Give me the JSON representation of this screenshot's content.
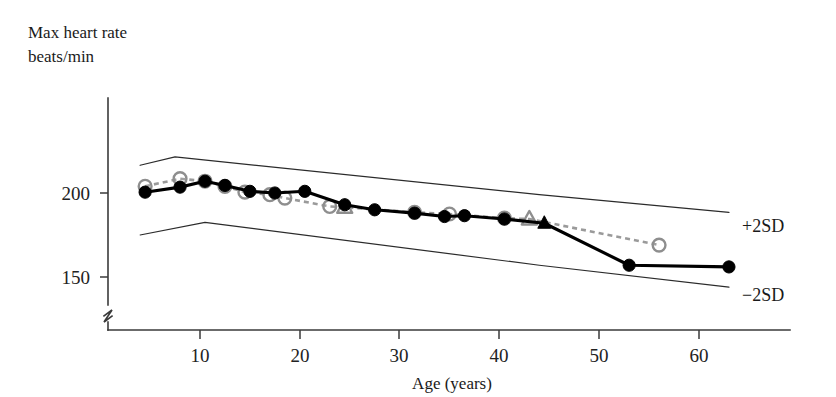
{
  "chart_data": {
    "type": "line",
    "title": "",
    "subtitle": "",
    "xlabel": "Age (years)",
    "ylabel_line1": "Max heart rate",
    "ylabel_line2": "beats/min",
    "xlim": [
      0,
      66
    ],
    "ylim": [
      130,
      235
    ],
    "grid": false,
    "axis_break": true,
    "legend_position": "right-inline",
    "x_ticks": [
      10,
      20,
      30,
      40,
      50,
      60
    ],
    "x_tick_labels": [
      "10",
      "20",
      "30",
      "40",
      "50",
      "60"
    ],
    "y_ticks": [
      150,
      200
    ],
    "y_tick_labels": [
      "150",
      "200"
    ],
    "annotations": [
      {
        "name": "upper-band-label",
        "text": "+2SD",
        "x": 64.5,
        "y": 188
      },
      {
        "name": "lower-band-label",
        "text": "−2SD",
        "x": 64.5,
        "y": 144
      }
    ],
    "series": [
      {
        "name": "+2SD",
        "style": "thin-solid",
        "marker": "none",
        "color": "#2b2b2b",
        "x": [
          4.0,
          7.5,
          44.0,
          63.0
        ],
        "y": [
          216.5,
          221.5,
          199.0,
          188.5
        ]
      },
      {
        "name": "−2SD",
        "style": "thin-solid",
        "marker": "none",
        "color": "#2b2b2b",
        "x": [
          4.0,
          10.5,
          44.0,
          63.0
        ],
        "y": [
          175.0,
          182.5,
          157.0,
          144.0
        ]
      },
      {
        "name": "cross-sectional (open circles, dashed)",
        "style": "dashed",
        "marker": "open-circle",
        "color": "#9a9a9a",
        "x": [
          4.5,
          8.0,
          10.5,
          12.5,
          14.5,
          17.0,
          18.5,
          23.0,
          24.5,
          31.5,
          35.0,
          40.5,
          43.0,
          56.0
        ],
        "y": [
          204.0,
          208.5,
          207.0,
          204.0,
          200.5,
          199.0,
          197.0,
          192.0,
          191.5,
          188.5,
          187.5,
          185.0,
          184.5,
          169.0
        ],
        "marker_overrides": [
          {
            "index": 8,
            "marker": "open-triangle"
          },
          {
            "index": 12,
            "marker": "open-triangle"
          }
        ]
      },
      {
        "name": "longitudinal (filled circles, solid)",
        "style": "solid",
        "marker": "filled-circle",
        "color": "#000000",
        "x": [
          4.5,
          8.0,
          10.5,
          12.5,
          15.0,
          17.5,
          20.5,
          24.5,
          27.5,
          31.5,
          34.5,
          36.5,
          40.5,
          44.5,
          53.0,
          63.0
        ],
        "y": [
          200.5,
          203.5,
          207.0,
          204.5,
          201.0,
          200.0,
          201.0,
          193.0,
          190.0,
          188.0,
          186.0,
          186.5,
          184.5,
          182.0,
          157.0,
          156.0
        ],
        "marker_overrides": [
          {
            "index": 13,
            "marker": "filled-triangle"
          }
        ]
      }
    ]
  },
  "axes": {
    "y_axis_name": "max-heart-rate-axis",
    "x_axis_name": "age-axis"
  }
}
